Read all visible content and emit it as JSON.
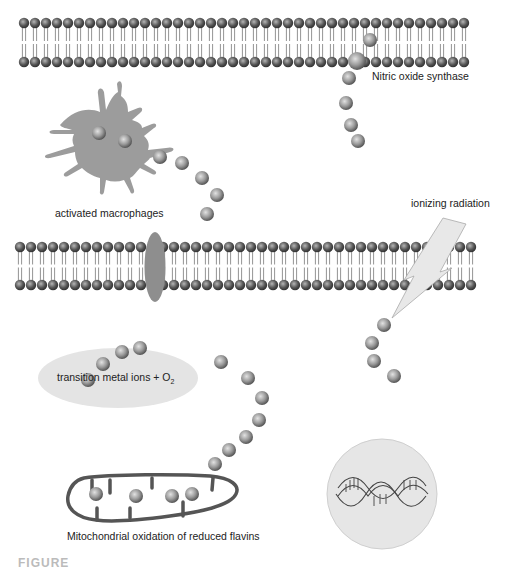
{
  "labels": {
    "nos": "Nitric oxide synthase",
    "macrophages": "activated macrophages",
    "ionizing": "ionizing radiation",
    "metal": "transition metal ions + O",
    "metal_sub": "2",
    "mito": "Mitochondrial oxidation of reduced flavins",
    "figure_caption": "FIGURE"
  },
  "colors": {
    "background": "#ffffff",
    "sphere_light": "#d9d9d9",
    "sphere_dark": "#5a5a5a",
    "cell_fill": "#9a9a9a",
    "ellipse_fill": "#e4e4e4",
    "dna_circle": "#e8e8e8",
    "mito_stroke": "#555555",
    "bolt_fill": "#e6e6e6"
  },
  "membranes": [
    {
      "name": "upper-membrane",
      "x_start": 24,
      "x_end": 470,
      "top_y": 23,
      "bottom_y": 62,
      "spacing": 11
    },
    {
      "name": "middle-membrane",
      "x_start": 20,
      "x_end": 472,
      "top_y": 247,
      "bottom_y": 285,
      "spacing": 11
    }
  ],
  "sphere_groups": {
    "nos_trail": [
      [
        370,
        40
      ],
      [
        357,
        61
      ],
      [
        349,
        78
      ],
      [
        346,
        103
      ],
      [
        351,
        125
      ],
      [
        358,
        141
      ]
    ],
    "macrophage_inner": [
      [
        99,
        133
      ],
      [
        125,
        141
      ]
    ],
    "macrophage_trail": [
      [
        160,
        157
      ],
      [
        182,
        163
      ],
      [
        202,
        178
      ],
      [
        217,
        195
      ],
      [
        207,
        214
      ]
    ],
    "radiation_trail": [
      [
        384,
        325
      ],
      [
        372,
        343
      ],
      [
        374,
        361
      ],
      [
        394,
        376
      ]
    ],
    "metal_trail": [
      [
        88,
        380
      ],
      [
        103,
        364
      ],
      [
        122,
        352
      ],
      [
        140,
        348
      ]
    ],
    "mito_arc": [
      [
        221,
        362
      ],
      [
        248,
        378
      ],
      [
        262,
        398
      ],
      [
        259,
        420
      ],
      [
        246,
        437
      ],
      [
        229,
        450
      ],
      [
        215,
        464
      ]
    ],
    "mito_inner": [
      [
        96,
        494
      ],
      [
        136,
        496
      ],
      [
        172,
        496
      ],
      [
        192,
        494
      ]
    ]
  }
}
